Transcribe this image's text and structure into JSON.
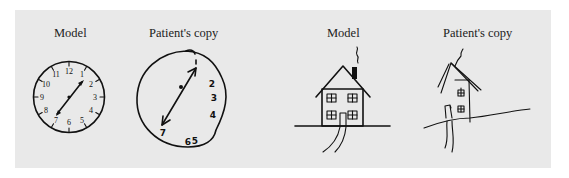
{
  "figure": {
    "background": "#e9e9e9",
    "panels": [
      {
        "id": "clock-model",
        "label": "Model",
        "subject": "clock"
      },
      {
        "id": "clock-patient",
        "label": "Patient's copy",
        "subject": "clock"
      },
      {
        "id": "house-model",
        "label": "Model",
        "subject": "house"
      },
      {
        "id": "house-patient",
        "label": "Patient's copy",
        "subject": "house"
      }
    ],
    "clock_model_numbers": [
      "12",
      "1",
      "2",
      "3",
      "4",
      "5",
      "6",
      "7",
      "8",
      "9",
      "10",
      "11"
    ],
    "clock_patient_numbers": [
      "2",
      "3",
      "4",
      "6",
      "5",
      "7"
    ]
  }
}
